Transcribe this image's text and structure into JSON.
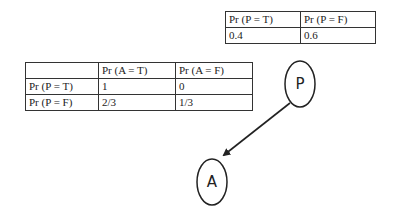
{
  "prior_table": {
    "headers": [
      "Pr (P = T)",
      "Pr (P = F)"
    ],
    "values": [
      "0.4",
      "0.6"
    ]
  },
  "cpt_table": {
    "headers": [
      "",
      "Pr (A = T)",
      "Pr (A = F)"
    ],
    "rows": [
      {
        "label": "Pr (P = T)",
        "values": [
          "1",
          "0"
        ]
      },
      {
        "label": "Pr (P = F)",
        "values": [
          "2/3",
          "1/3"
        ]
      }
    ]
  },
  "nodes": {
    "parent": {
      "label": "P"
    },
    "child": {
      "label": "A"
    }
  },
  "edges": [
    {
      "from": "P",
      "to": "A"
    }
  ]
}
